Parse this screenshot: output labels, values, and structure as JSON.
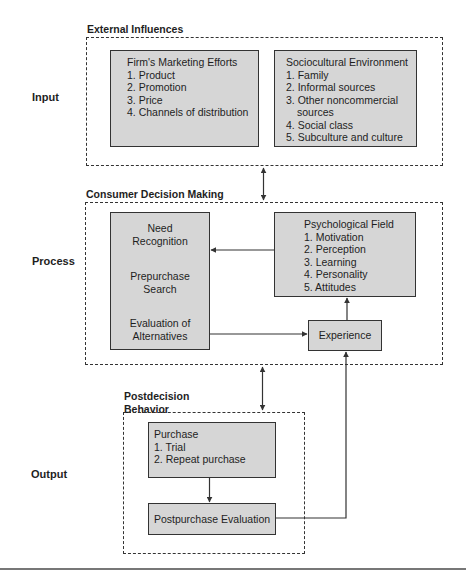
{
  "side_labels": {
    "input": "Input",
    "process": "Process",
    "output": "Output"
  },
  "external_influences": {
    "label": "External Influences",
    "firm_marketing": {
      "title": "Firm's Marketing Efforts",
      "items": [
        "1. Product",
        "2. Promotion",
        "3. Price",
        "4. Channels of distribution"
      ]
    },
    "sociocultural": {
      "title": "Sociocultural Environment",
      "items": [
        "1. Family",
        "2. Informal sources",
        "3. Other noncommercial",
        "sources",
        "4. Social class",
        "5. Subculture and culture"
      ]
    }
  },
  "consumer_decision_making": {
    "label": "Consumer Decision Making",
    "stages": {
      "need_1": "Need",
      "need_2": "Recognition",
      "search_1": "Prepurchase",
      "search_2": "Search",
      "eval_1": "Evaluation of",
      "eval_2": "Alternatives"
    },
    "psychological_field": {
      "title": "Psychological Field",
      "items": [
        "1. Motivation",
        "2. Perception",
        "3. Learning",
        "4. Personality",
        "5. Attitudes"
      ]
    },
    "experience": "Experience"
  },
  "postdecision_behavior": {
    "label_line1": "Postdecision",
    "label_line2": "Behavior",
    "purchase": {
      "title": "Purchase",
      "items": [
        "1. Trial",
        "2. Repeat purchase"
      ]
    },
    "postpurchase": "Postpurchase Evaluation"
  },
  "colors": {
    "box_fill": "#d6d6d6",
    "line": "#333333"
  }
}
